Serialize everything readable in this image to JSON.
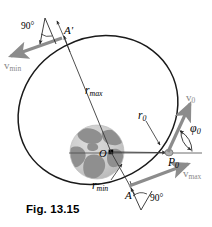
{
  "figure": {
    "caption": "Fig. 13.15"
  },
  "colors": {
    "orbit_stroke": "#1a1a1a",
    "velocity_arrow": "#8c8c8c",
    "leader_line": "#2b2b2b",
    "earth_ocean": "#c9c9c9",
    "earth_land": "#8f8f8f",
    "focus_dot": "#000000",
    "label_gray": "#8a8a8a",
    "background": "#ffffff"
  },
  "labels": {
    "angle_top": "90°",
    "angle_bottom": "90°",
    "apogee_point": "A'",
    "perigee_point": "A",
    "launch_point": "P",
    "launch_point_sub": "0",
    "center_point": "O",
    "r_max": "r",
    "r_max_sub": "max",
    "r_min": "r",
    "r_min_sub": "min",
    "r_zero": "r",
    "r_zero_sub": "0",
    "v_min": "v",
    "v_min_sub": "min",
    "v_max": "v",
    "v_max_sub": "max",
    "v_zero": "v",
    "v_zero_sub": "0",
    "phi_zero": "φ",
    "phi_zero_sub": "0"
  },
  "geometry": {
    "ellipse": {
      "center_x": 98,
      "center_y": 110,
      "radius_x": 82,
      "radius_y": 72,
      "rotation_deg": -28
    },
    "earth": {
      "center_x": 97,
      "center_y": 152,
      "radius": 27
    },
    "focus": {
      "x": 111,
      "y": 152
    },
    "apogee": {
      "x": 62,
      "y": 33
    },
    "perigee": {
      "x": 133,
      "y": 184
    },
    "launch": {
      "x": 169,
      "y": 153
    },
    "horizontal_reference": {
      "x1": 68,
      "y1": 153,
      "x2": 202,
      "y2": 153
    }
  },
  "annotations": [
    {
      "name": "r-max",
      "text": "distance from focus to apogee"
    },
    {
      "name": "r-min",
      "text": "distance from focus to perigee"
    },
    {
      "name": "r-zero",
      "text": "initial radius at launch point"
    },
    {
      "name": "phi-zero",
      "text": "flight path angle at launch"
    }
  ]
}
